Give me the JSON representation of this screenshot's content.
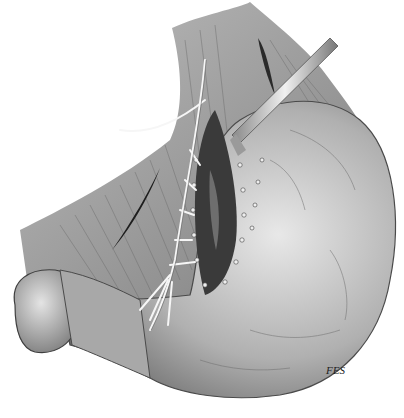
{
  "illustration": {
    "subject": "surgical illustration of stomach with opened lesser curvature, sutures, vessels and drain tube",
    "style": "grayscale pencil/ink rendering",
    "signature": "FES",
    "colors": {
      "background": "#ffffff",
      "tissue_light": "#d8d8d8",
      "tissue_mid": "#9a9a9a",
      "tissue_dark": "#3a3a3a",
      "vessel": "#f4f4f4"
    }
  }
}
